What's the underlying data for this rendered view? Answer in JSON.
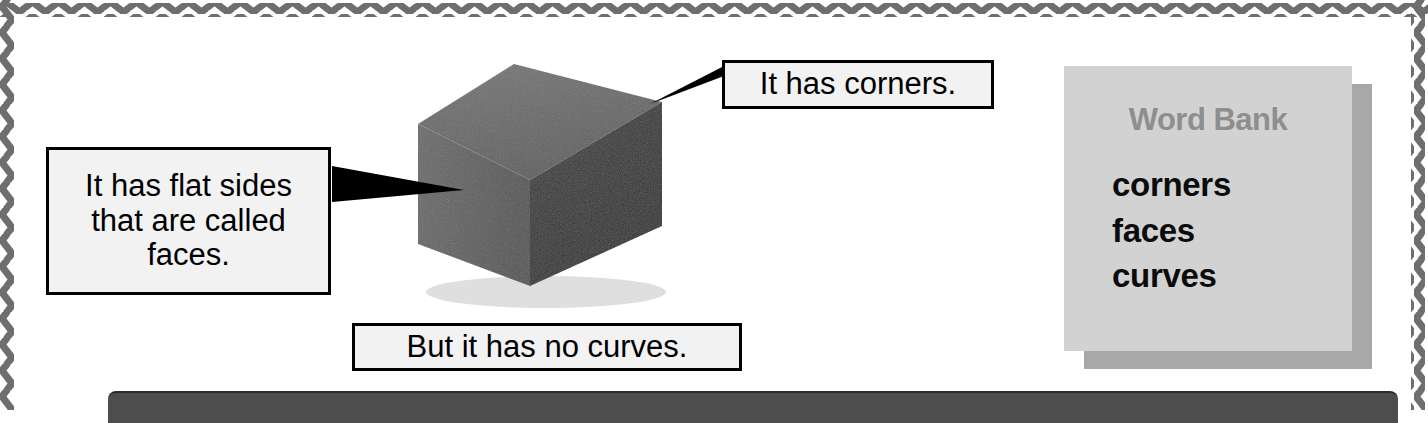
{
  "page": {
    "background_color": "#ffffff",
    "border_color": "#6e6e6e",
    "border_style": "zigzag"
  },
  "illustration": {
    "name": "gray-foam-cube",
    "description": "Photograph of a gray foam cube shown in three-quarter view",
    "top_face_color": "#6a6a6a",
    "left_face_color": "#616161",
    "right_face_color": "#3a3a3a",
    "shadow_color": "#d8d8d8"
  },
  "callouts": [
    {
      "id": "corners",
      "text": "It has corners.",
      "pointer_side": "left",
      "target": "cube-top-right-corner"
    },
    {
      "id": "faces",
      "text": "It has flat sides\nthat are called\nfaces.",
      "pointer_side": "right",
      "target": "cube-left-face"
    },
    {
      "id": "curves",
      "text": "But it has no curves.",
      "pointer_side": "none",
      "target": ""
    }
  ],
  "word_bank": {
    "title": "Word Bank",
    "title_color": "#8e8e8e",
    "panel_color": "#d2d2d2",
    "shadow_color": "#a8a8a8",
    "words": [
      "corners",
      "faces",
      "curves"
    ]
  },
  "bottom_bar": {
    "color": "#4d4d4d"
  }
}
